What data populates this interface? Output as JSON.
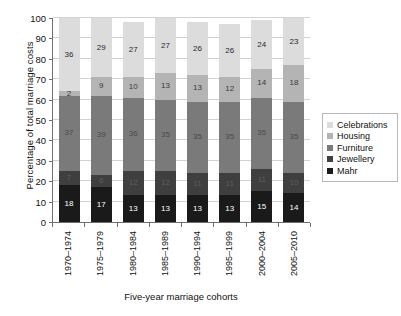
{
  "chart_data": {
    "type": "bar",
    "stacked": true,
    "stack_mode": "percent",
    "title": "",
    "xlabel": "Five-year marriage cohorts",
    "ylabel": "Percentage of total marriage costs",
    "ylim": [
      0,
      100
    ],
    "ytick_step": 10,
    "yticks": [
      0,
      10,
      20,
      30,
      40,
      50,
      60,
      70,
      80,
      90,
      100
    ],
    "ytick_labels": [
      "0",
      "10",
      "20",
      "30",
      "40",
      "50",
      "60",
      "70",
      "80",
      "90",
      "100"
    ],
    "grid": true,
    "legend_position": "right",
    "categories": [
      "1970–1974",
      "1975–1979",
      "1980–1984",
      "1985–1989",
      "1990–1994",
      "1995–1999",
      "2000–2004",
      "2005–2010"
    ],
    "series": [
      {
        "name": "Mahr",
        "color": "#1a1a1a",
        "label_color": "#ffffff",
        "values": [
          18,
          17,
          13,
          13,
          13,
          13,
          15,
          14
        ]
      },
      {
        "name": "Jewellery",
        "color": "#3f3f3f",
        "label_color": "#5e5e5e",
        "values": [
          7,
          6,
          12,
          12,
          11,
          11,
          11,
          10
        ]
      },
      {
        "name": "Furniture",
        "color": "#7a7a7a",
        "label_color": "#4a4a4a",
        "values": [
          37,
          39,
          36,
          35,
          35,
          35,
          35,
          35
        ]
      },
      {
        "name": "Housing",
        "color": "#b4b4b4",
        "label_color": "#3a3a3a",
        "values": [
          2,
          9,
          10,
          13,
          13,
          12,
          14,
          18
        ]
      },
      {
        "name": "Celebrations",
        "color": "#dcdcdc",
        "label_color": "#2a2a2a",
        "values": [
          36,
          29,
          27,
          27,
          26,
          26,
          24,
          23
        ]
      }
    ],
    "legend_order": [
      "Celebrations",
      "Housing",
      "Furniture",
      "Jewellery",
      "Mahr"
    ]
  },
  "axis": {
    "y_title": "Percentage of total marriage costs",
    "x_title": "Five-year marriage cohorts"
  }
}
